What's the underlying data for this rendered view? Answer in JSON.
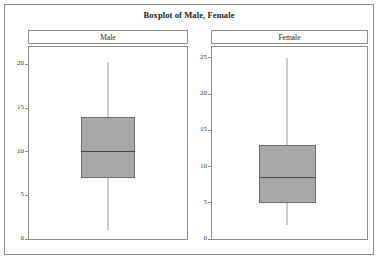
{
  "figure": {
    "title": "Boxplot of Male, Female",
    "background_color": "#ffffff",
    "frame_color": "#8d8d8d"
  },
  "chart_data": {
    "type": "box",
    "title": "Boxplot of Male, Female",
    "xlabel": "",
    "ylabel": "",
    "grid": false,
    "legend": "none",
    "panels": [
      {
        "label": "Male",
        "ylim": [
          0,
          22
        ],
        "yticks": [
          0,
          5,
          10,
          15,
          20
        ],
        "ytick_labels": [
          "0",
          "5",
          "10",
          "15",
          "20"
        ],
        "stats": {
          "whisker_low": 1.0,
          "q1": 7.0,
          "median": 10.1,
          "q3": 14.0,
          "whisker_high": 20.3
        },
        "outliers": []
      },
      {
        "label": "Female",
        "ylim": [
          0,
          26.5
        ],
        "yticks": [
          0,
          5,
          10,
          15,
          20,
          25
        ],
        "ytick_labels": [
          "0",
          "5",
          "10",
          "15",
          "20",
          "25"
        ],
        "stats": {
          "whisker_low": 2.0,
          "q1": 5.0,
          "median": 8.5,
          "q3": 13.0,
          "whisker_high": 25.0
        },
        "outliers": []
      }
    ],
    "colors": {
      "box_fill": "#a8a8a8",
      "box_edge": "#6e6e6e",
      "median": "#4a4a4a",
      "whisker": "#9a9a9a"
    }
  }
}
